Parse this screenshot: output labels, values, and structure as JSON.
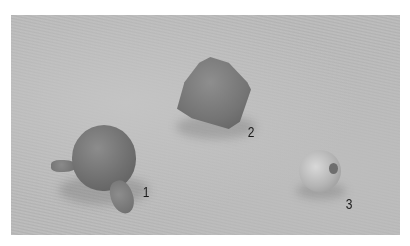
{
  "image": {
    "description": "Photograph of three small clay objects on a textured grey surface, each labeled with a number",
    "objects": [
      {
        "label": "1",
        "description": "round clay object with two small protrusions"
      },
      {
        "label": "2",
        "description": "conical/domed clay object"
      },
      {
        "label": "3",
        "description": "small light-colored bead with a hole"
      }
    ]
  }
}
